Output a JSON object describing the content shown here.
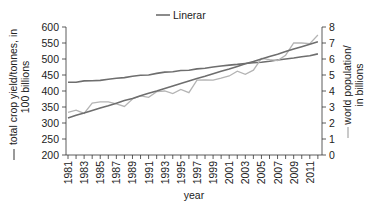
{
  "chart_data": {
    "type": "line",
    "title": "",
    "legend": [
      {
        "label": "Linerar",
        "color": "#6e6e6e"
      }
    ],
    "xlabel": "year",
    "ylabel_left": "total crop yield/tonnes, in 100 billions",
    "ylabel_left_line1": "total crop yield/tonnes, in",
    "ylabel_left_line2": "100 billions",
    "ylabel_right": "world population/ in billions",
    "ylabel_right_line1": "world population/",
    "ylabel_right_line2": "in billions",
    "ylim_left": [
      200,
      600
    ],
    "ylim_right": [
      0,
      8
    ],
    "yticks_left": [
      "600",
      "550",
      "500",
      "450",
      "400",
      "350",
      "300",
      "250",
      "200"
    ],
    "yticks_right": [
      "8",
      "7",
      "6",
      "5",
      "4",
      "3",
      "2",
      "1",
      "0"
    ],
    "xtick_labels": [
      "1981",
      "1983",
      "1985",
      "1987",
      "1989",
      "1991",
      "1993",
      "1995",
      "1997",
      "1999",
      "2001",
      "2003",
      "2005",
      "2007",
      "2009",
      "2011"
    ],
    "x": [
      1981,
      1982,
      1983,
      1984,
      1985,
      1986,
      1987,
      1988,
      1989,
      1990,
      1991,
      1992,
      1993,
      1994,
      1995,
      1996,
      1997,
      1998,
      1999,
      2000,
      2001,
      2002,
      2003,
      2004,
      2005,
      2006,
      2007,
      2008,
      2009,
      2010,
      2011,
      2012
    ],
    "series": [
      {
        "name": "world population (smooth, dark)",
        "axis": "right",
        "color": "#6e6e6e",
        "values": [
          4.55,
          4.55,
          4.63,
          4.64,
          4.66,
          4.74,
          4.8,
          4.84,
          4.92,
          4.98,
          5.0,
          5.1,
          5.18,
          5.2,
          5.28,
          5.3,
          5.38,
          5.42,
          5.5,
          5.56,
          5.62,
          5.66,
          5.72,
          5.76,
          5.8,
          5.86,
          5.94,
          6.0,
          6.06,
          6.14,
          6.2,
          6.32
        ]
      },
      {
        "name": "total crop yield (jagged, light)",
        "axis": "left",
        "color": "#b4b4b4",
        "values": [
          333,
          340,
          330,
          362,
          366,
          366,
          360,
          352,
          375,
          385,
          380,
          398,
          400,
          392,
          405,
          395,
          434,
          435,
          434,
          440,
          447,
          462,
          452,
          465,
          502,
          498,
          495,
          512,
          550,
          550,
          548,
          575
        ]
      },
      {
        "name": "Linerar",
        "axis": "left",
        "color": "#6e6e6e",
        "values": [
          316,
          324,
          331,
          339,
          347,
          354,
          362,
          370,
          377,
          385,
          393,
          400,
          408,
          416,
          423,
          431,
          439,
          446,
          454,
          462,
          469,
          477,
          485,
          492,
          500,
          508,
          515,
          523,
          531,
          538,
          546,
          554
        ]
      }
    ],
    "grid": false
  }
}
